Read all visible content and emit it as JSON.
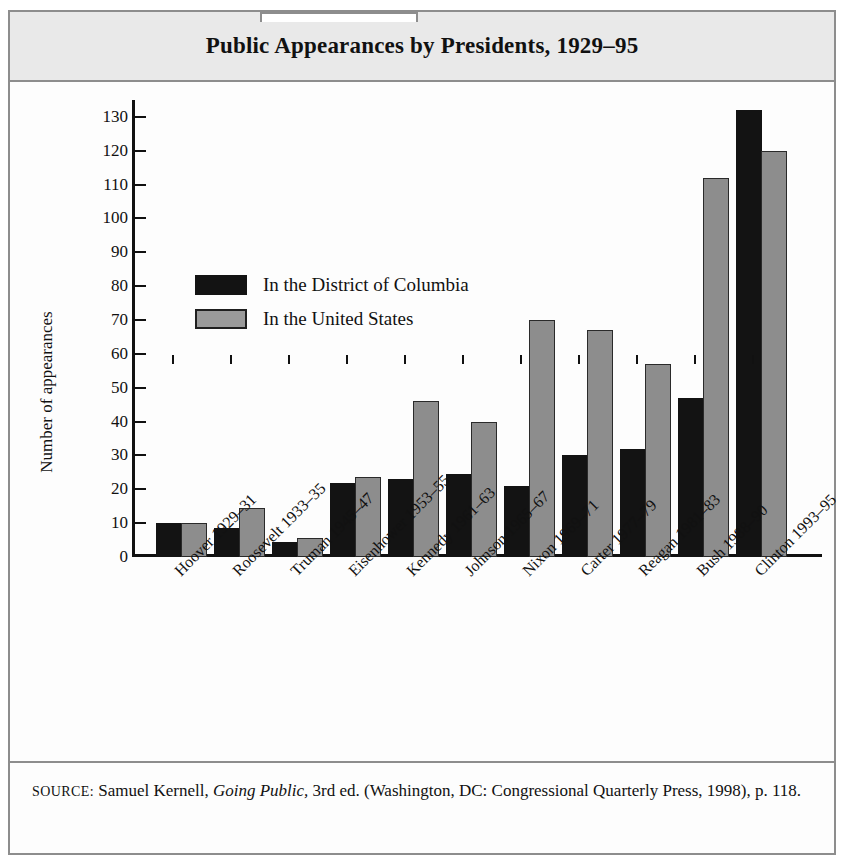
{
  "figure": {
    "tab_label": "",
    "title": "Public Appearances by Presidents, 1929–95"
  },
  "chart_data": {
    "type": "bar",
    "title": "Public Appearances by Presidents, 1929–95",
    "xlabel": "",
    "ylabel": "Number of appearances",
    "ylim": [
      0,
      135
    ],
    "yticks": [
      0,
      10,
      20,
      30,
      40,
      50,
      60,
      70,
      80,
      90,
      100,
      110,
      120,
      130
    ],
    "ytick_labels": [
      "0",
      "10",
      "20",
      "30",
      "40",
      "50",
      "60",
      "70",
      "80",
      "90",
      "100",
      "110",
      "120",
      "130"
    ],
    "grid": false,
    "legend_position": "upper left inside",
    "categories": [
      "Hoover 1929–31",
      "Roosevelt 1933–35",
      "Truman 1945–47",
      "Eisenhower 1953–55",
      "Kennedy 1961–63",
      "Johnson 1965–67",
      "Nixon 1969–71",
      "Carter 1977–79",
      "Reagan 1981–83",
      "Bush 1988–90",
      "Clinton 1993–95"
    ],
    "series": [
      {
        "name": "In the District of Columbia",
        "color": "#131313",
        "values": [
          10,
          8.5,
          4.5,
          22,
          23,
          24.5,
          21,
          30,
          32,
          47,
          132
        ]
      },
      {
        "name": "In the United States",
        "color": "#8d8d8d",
        "values": [
          10,
          14.5,
          5.5,
          23.5,
          46,
          40,
          70,
          67,
          57,
          112,
          120
        ]
      }
    ]
  },
  "source": {
    "label": "SOURCE:",
    "part1": " Samuel Kernell, ",
    "book": "Going Public,",
    "part2": " 3rd ed. (Washington, DC: Congressional Quarterly Press, 1998), p. 118."
  }
}
